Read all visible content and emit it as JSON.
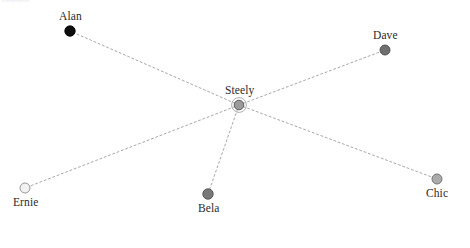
{
  "figure": {
    "type": "network-graph",
    "width": 470,
    "height": 248,
    "background": "#ffffff",
    "clipped_header_text": "vbmmb"
  },
  "chart_data": {
    "type": "scatter",
    "title": "",
    "xlabel": "",
    "ylabel": "",
    "layout": "star / hub-and-spoke",
    "hub": "Steely",
    "nodes": [
      {
        "id": "alan",
        "label": "Alan",
        "x": 70,
        "y": 31,
        "radius": 5.2,
        "fill": "#0d0d0d",
        "stroke": "#000000",
        "label_position": "above"
      },
      {
        "id": "dave",
        "label": "Dave",
        "x": 385,
        "y": 50,
        "radius": 5.0,
        "fill": "#6f6f6f",
        "stroke": "#4a4a4a",
        "label_position": "above"
      },
      {
        "id": "steely",
        "label": "Steely",
        "x": 239,
        "y": 105,
        "radius": 4.8,
        "fill": "#9a9a9a",
        "stroke": "#555555",
        "label_position": "above",
        "halo": true
      },
      {
        "id": "chic",
        "label": "Chic",
        "x": 437,
        "y": 179,
        "radius": 5.0,
        "fill": "#ababab",
        "stroke": "#6b6b6b",
        "label_position": "below"
      },
      {
        "id": "bela",
        "label": "Bela",
        "x": 208,
        "y": 194,
        "radius": 5.2,
        "fill": "#787878",
        "stroke": "#4f4f4f",
        "label_position": "below"
      },
      {
        "id": "ernie",
        "label": "Ernie",
        "x": 25,
        "y": 188,
        "radius": 5.0,
        "fill": "#f2f2f2",
        "stroke": "#8c8c8c",
        "label_position": "below"
      }
    ],
    "edges": [
      {
        "source": "steely",
        "target": "alan"
      },
      {
        "source": "steely",
        "target": "dave"
      },
      {
        "source": "steely",
        "target": "chic"
      },
      {
        "source": "steely",
        "target": "bela"
      },
      {
        "source": "steely",
        "target": "ernie"
      }
    ],
    "edge_style": {
      "color": "#9e9e9e",
      "width": 0.9,
      "dash": "2,2.6"
    },
    "legend": null,
    "grid": false
  }
}
